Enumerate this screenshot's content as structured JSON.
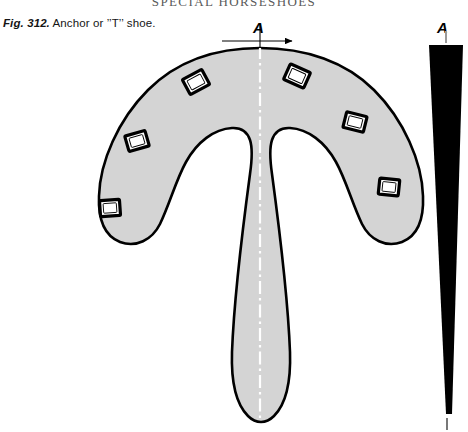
{
  "page": {
    "running_head": "SPECIAL HORSESHOES",
    "background_color": "#ffffff"
  },
  "caption": {
    "figure_number": "Fig. 312.",
    "text": "Anchor or ’’T’’ shoe."
  },
  "section_marks": {
    "left_label": "A",
    "right_label": "A"
  },
  "colors": {
    "shoe_fill": "#d4d4d4",
    "shoe_outline": "#000000",
    "hole_fill": "#ffffff",
    "section_fill": "#000000",
    "centerline": "#ffffff",
    "axis_line": "#000000",
    "running_head_color": "#5a5a5a"
  },
  "figure": {
    "name": "anchor-or-t-shoe",
    "view": "plan view of horseshoe with central T stem",
    "nail_holes_left": [
      {
        "x": 196,
        "y": 82,
        "rotation": -28
      },
      {
        "x": 137,
        "y": 141,
        "rotation": -16
      },
      {
        "x": 110,
        "y": 208,
        "rotation": -4
      }
    ],
    "nail_holes_right": [
      {
        "x": 297,
        "y": 76,
        "rotation": 24
      },
      {
        "x": 355,
        "y": 122,
        "rotation": 14
      },
      {
        "x": 389,
        "y": 187,
        "rotation": 6
      }
    ],
    "nail_hole_count": 6,
    "centerline_x": 260,
    "shoe_top_y": 48,
    "shoe_bottom_y": 424
  },
  "section_view": {
    "name": "section-a-a",
    "description": "tapered wedge cross-section",
    "top_y": 43,
    "bottom_y": 415,
    "top_width": 34,
    "bottom_width": 7,
    "left_x": 429
  }
}
